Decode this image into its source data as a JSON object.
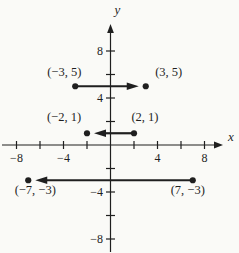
{
  "figure": {
    "background": "#fafaf7",
    "ink": "#1f1f1f",
    "width": 239,
    "height": 253
  },
  "chart_data": {
    "type": "scatter",
    "title": "",
    "subtitle": "",
    "xlabel": "x",
    "ylabel": "y",
    "xlim": [
      -9.2,
      9.6
    ],
    "ylim": [
      -9.2,
      10.3
    ],
    "tick_step": 2,
    "grid": false,
    "legend": false,
    "x_ticks": [
      -8,
      -6,
      -4,
      -2,
      2,
      4,
      6,
      8
    ],
    "y_ticks": [
      -8,
      -6,
      -4,
      -2,
      2,
      4,
      6,
      8
    ],
    "x_tick_labels": [
      {
        "v": -8,
        "label": "−8"
      },
      {
        "v": -4,
        "label": "−4"
      },
      {
        "v": 4,
        "label": "4"
      },
      {
        "v": 8,
        "label": "8"
      }
    ],
    "y_tick_labels": [
      {
        "v": -8,
        "label": "−8"
      },
      {
        "v": -4,
        "label": "−4"
      },
      {
        "v": 4,
        "label": "4"
      },
      {
        "v": 8,
        "label": "8"
      }
    ],
    "vectors": [
      {
        "from": {
          "x": -3,
          "y": 5,
          "label": "(−3, 5)",
          "label_offset": [
            -11,
            -14
          ]
        },
        "to": {
          "x": 3,
          "y": 5,
          "label": "(3, 5)",
          "label_offset": [
            23,
            -14
          ]
        }
      },
      {
        "from": {
          "x": 2,
          "y": 1,
          "label": "(2, 1)",
          "label_offset": [
            11,
            -16
          ]
        },
        "to": {
          "x": -2,
          "y": 1,
          "label": "(−2, 1)",
          "label_offset": [
            -23,
            -16
          ]
        }
      },
      {
        "from": {
          "x": 7,
          "y": -3,
          "label": "(7, −3)",
          "label_offset": [
            -5,
            10
          ]
        },
        "to": {
          "x": -7,
          "y": -3,
          "label": "(−7, −3)",
          "label_offset": [
            7,
            10
          ]
        }
      }
    ]
  }
}
